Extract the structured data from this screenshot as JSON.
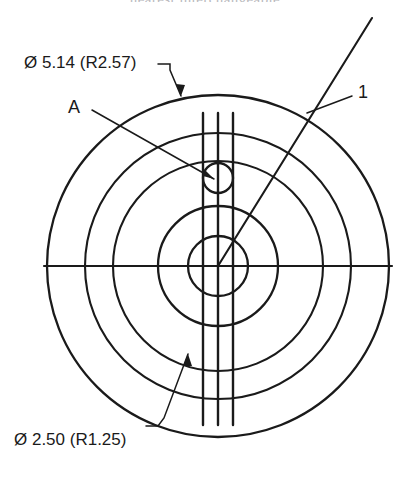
{
  "drawing": {
    "type": "engineering-cross-section",
    "background": "#ffffff",
    "line_color": "#1a1a1a",
    "cropped_caption_top": "nearest interchangeable",
    "center": {
      "x": 218,
      "y": 266
    },
    "callouts": {
      "outer_diameter_label": "Ø 5.14 (R2.57)",
      "inner_diameter_label": "Ø 2.50 (R1.25)",
      "detail_label": "A",
      "item_number_label": "1"
    },
    "circles": [
      {
        "name": "outer-circle",
        "radius": 171
      },
      {
        "name": "second-circle",
        "radius": 133
      },
      {
        "name": "third-circle",
        "radius": 105
      },
      {
        "name": "fourth-circle",
        "radius": 60
      },
      {
        "name": "inner-circle",
        "radius": 30
      },
      {
        "name": "small-circle-a",
        "radius": 15,
        "cx": 218,
        "cy": 178
      }
    ],
    "vertical_lines_x": [
      203,
      218,
      233
    ],
    "vertical_lines_span": {
      "y1": 113,
      "y2": 425
    },
    "centerline": {
      "x1": 44,
      "x2": 392,
      "y": 266
    },
    "pointer_line": {
      "x1": 372,
      "y1": 18,
      "x2": 218,
      "y2": 266
    }
  }
}
